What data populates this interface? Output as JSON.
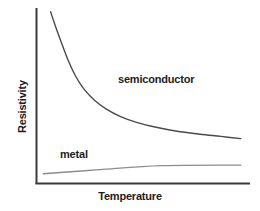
{
  "chart_data": {
    "type": "line",
    "title": "",
    "subtitle": "",
    "xlabel": "Temperature",
    "ylabel": "Resistivity",
    "grid": false,
    "legend_position": "inline-annotations",
    "axis_style": {
      "ticks": "none",
      "tick_labels": "none",
      "x_axis_color": "#3a3a3a",
      "y_axis_color": "#3a3a3a"
    },
    "xlim": [
      0,
      1
    ],
    "ylim": [
      0,
      1
    ],
    "annotations": [
      {
        "text": "semiconductor",
        "x": 0.38,
        "y": 0.64
      },
      {
        "text": "metal",
        "x": 0.11,
        "y": 0.21
      }
    ],
    "series": [
      {
        "name": "semiconductor",
        "color": "#4a4a4a",
        "width": 1.4,
        "description": "steep exponential-like decay that flattens into a long tail",
        "points": [
          {
            "x": 0.065,
            "y": 0.99
          },
          {
            "x": 0.09,
            "y": 0.9
          },
          {
            "x": 0.12,
            "y": 0.8
          },
          {
            "x": 0.15,
            "y": 0.705
          },
          {
            "x": 0.185,
            "y": 0.615
          },
          {
            "x": 0.225,
            "y": 0.54
          },
          {
            "x": 0.275,
            "y": 0.475
          },
          {
            "x": 0.33,
            "y": 0.425
          },
          {
            "x": 0.4,
            "y": 0.38
          },
          {
            "x": 0.48,
            "y": 0.345
          },
          {
            "x": 0.57,
            "y": 0.318
          },
          {
            "x": 0.67,
            "y": 0.295
          },
          {
            "x": 0.78,
            "y": 0.278
          },
          {
            "x": 0.88,
            "y": 0.265
          },
          {
            "x": 0.975,
            "y": 0.252
          }
        ]
      },
      {
        "name": "metal",
        "color": "#8c8c8c",
        "width": 1.4,
        "description": "nearly flat line rising slowly and linearly with temperature",
        "points": [
          {
            "x": 0.03,
            "y": 0.048
          },
          {
            "x": 0.3,
            "y": 0.072
          },
          {
            "x": 0.6,
            "y": 0.095
          },
          {
            "x": 0.975,
            "y": 0.098
          }
        ]
      }
    ]
  }
}
